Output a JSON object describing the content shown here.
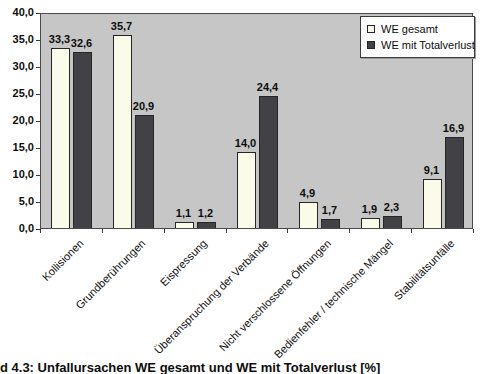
{
  "chart_data": {
    "type": "bar",
    "title": "",
    "xlabel": "",
    "ylabel": "",
    "categories": [
      "Kollisionen",
      "Grundberührungen",
      "Eispressung",
      "Überanspruchung der Verbände",
      "Nicht verschlossene Öffnungen",
      "Bedienfehler / technische Mängel",
      "Stabilitätsunfälle"
    ],
    "series": [
      {
        "name": "WE gesamt",
        "color": "#fbfbe9",
        "values": [
          33.3,
          35.7,
          1.1,
          14.0,
          4.9,
          1.9,
          9.1
        ]
      },
      {
        "name": "WE mit Totalverlust",
        "color": "#424246",
        "values": [
          32.6,
          20.9,
          1.2,
          24.4,
          1.7,
          2.3,
          16.9
        ]
      }
    ],
    "ylim": [
      0,
      40
    ],
    "ytick_step": 5,
    "ytick_labels": [
      "0,0",
      "5,0",
      "10,0",
      "15,0",
      "20,0",
      "25,0",
      "30,0",
      "35,0",
      "40,0"
    ],
    "decimal_separator": ",",
    "value_labels_shown": true,
    "grid": false,
    "legend_position": "top-right",
    "plot_bg_color": "#c6c6c6",
    "bar_border_color": "#262626"
  },
  "caption": "d 4.3: Unfallursachen WE gesamt und WE mit Totalverlust [%]"
}
